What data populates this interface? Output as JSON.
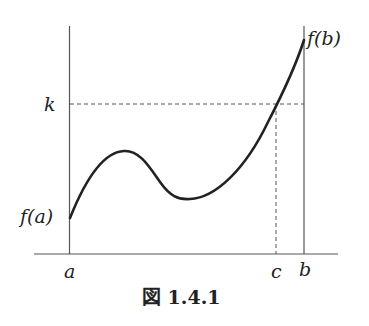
{
  "figure": {
    "caption": "図 1.4.1",
    "labels": {
      "k": "k",
      "fa": "f(a)",
      "fb": "f(b)",
      "a": "a",
      "c": "c",
      "b": "b"
    }
  },
  "colors": {
    "curve": "#222222",
    "axis": "#555555",
    "dashed": "#555555"
  }
}
